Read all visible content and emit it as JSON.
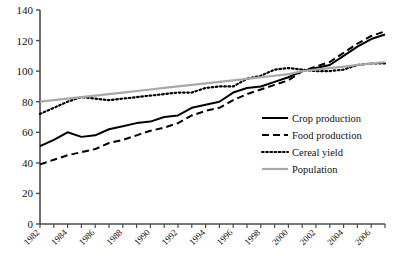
{
  "chart_data": {
    "type": "line",
    "title": "",
    "xlabel": "",
    "ylabel": "",
    "xlim": [
      1982,
      2007
    ],
    "ylim": [
      0,
      140
    ],
    "grid": false,
    "legend_position": "right-middle",
    "x": [
      1982,
      1983,
      1984,
      1985,
      1986,
      1987,
      1988,
      1989,
      1990,
      1991,
      1992,
      1993,
      1994,
      1995,
      1996,
      1997,
      1998,
      1999,
      2000,
      2001,
      2002,
      2003,
      2004,
      2005,
      2006,
      2007
    ],
    "xticks": [
      1982,
      1984,
      1986,
      1988,
      1990,
      1992,
      1994,
      1996,
      1998,
      2000,
      2002,
      2004,
      2006
    ],
    "xtick_labels": [
      "1982",
      "1984",
      "1986",
      "1988",
      "1990",
      "1992",
      "1994",
      "1996",
      "1998",
      "2000",
      "2002",
      "2004",
      "2006"
    ],
    "yticks": [
      0,
      20,
      40,
      60,
      80,
      100,
      120,
      140
    ],
    "ytick_labels": [
      "0",
      "20",
      "40",
      "60",
      "80",
      "100",
      "120",
      "140"
    ],
    "series": [
      {
        "name": "Crop production",
        "style": "solid",
        "color": "#000000",
        "width": 2.0,
        "values": [
          51,
          55,
          60,
          57,
          58,
          62,
          64,
          66,
          67,
          70,
          71,
          76,
          78,
          80,
          86,
          89,
          90,
          93,
          96,
          100,
          102,
          104,
          110,
          116,
          121,
          124
        ]
      },
      {
        "name": "Food production",
        "style": "dashed",
        "color": "#000000",
        "width": 2.0,
        "values": [
          39,
          42,
          45,
          47,
          49,
          53,
          55,
          58,
          61,
          63,
          66,
          71,
          74,
          76,
          81,
          85,
          88,
          91,
          94,
          100,
          103,
          106,
          112,
          118,
          123,
          126
        ]
      },
      {
        "name": "Cereal yield",
        "style": "dotted",
        "color": "#000000",
        "width": 2.2,
        "values": [
          72,
          76,
          80,
          83,
          82,
          81,
          82,
          83,
          84,
          85,
          86,
          86,
          89,
          90,
          90,
          95,
          97,
          101,
          102,
          101,
          100,
          100,
          101,
          104,
          105,
          105
        ]
      },
      {
        "name": "Population",
        "style": "solid",
        "color": "#a8a8a8",
        "width": 2.2,
        "values": [
          80,
          81,
          82,
          83,
          84,
          85,
          86,
          87,
          88,
          89,
          90,
          91,
          92,
          93,
          94,
          95,
          96,
          97,
          98,
          100,
          101,
          102,
          103,
          104,
          105,
          106
        ]
      }
    ]
  },
  "legend": {
    "items": [
      {
        "label": "Crop production",
        "swatch": "solid-black"
      },
      {
        "label": "Food production",
        "swatch": "dashed-black"
      },
      {
        "label": "Cereal yield",
        "swatch": "dotted-black"
      },
      {
        "label": "Population",
        "swatch": "solid-gray"
      }
    ]
  },
  "axes": {
    "y_axis_name": "value-axis",
    "x_axis_name": "year-axis"
  }
}
